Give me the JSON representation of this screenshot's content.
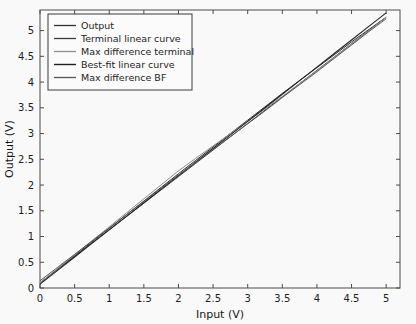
{
  "chart_data": {
    "type": "line",
    "title": "",
    "xlabel": "Input (V)",
    "ylabel": "Output (V)",
    "xlim": [
      0,
      5.2
    ],
    "ylim": [
      0,
      5.4
    ],
    "grid": false,
    "legend_position": "upper left",
    "xticks": [
      "0",
      "0.5",
      "1",
      "1.5",
      "2",
      "2.5",
      "3",
      "3.5",
      "4",
      "4.5",
      "5"
    ],
    "xtick_values": [
      0,
      0.5,
      1,
      1.5,
      2,
      2.5,
      3,
      3.5,
      4,
      4.5,
      5
    ],
    "yticks": [
      "0",
      "0.5",
      "1",
      "1.5",
      "2",
      "2.5",
      "3",
      "3.5",
      "4",
      "4.5",
      "5"
    ],
    "ytick_values": [
      0,
      0.5,
      1,
      1.5,
      2,
      2.5,
      3,
      3.5,
      4,
      4.5,
      5
    ],
    "x": [
      0,
      0.25,
      0.5,
      0.75,
      1,
      1.25,
      1.5,
      1.75,
      2,
      2.25,
      2.5,
      2.75,
      3,
      3.25,
      3.5,
      3.75,
      4,
      4.25,
      4.5,
      4.75,
      5
    ],
    "series": [
      {
        "name": "Output",
        "color": "#2c2c2c",
        "width": 1.0,
        "values": [
          0.1,
          0.365,
          0.63,
          0.895,
          1.16,
          1.425,
          1.69,
          1.955,
          2.22,
          2.48,
          2.74,
          3.0,
          3.26,
          3.52,
          3.78,
          4.03,
          4.28,
          4.53,
          4.78,
          5.02,
          5.26
        ]
      },
      {
        "name": "Terminal linear curve",
        "color": "#3a3a3a",
        "width": 1.0,
        "values": [
          0.1,
          0.358,
          0.616,
          0.874,
          1.132,
          1.39,
          1.648,
          1.906,
          2.164,
          2.422,
          2.68,
          2.938,
          3.196,
          3.454,
          3.712,
          3.97,
          4.228,
          4.486,
          4.744,
          5.002,
          5.26
        ]
      },
      {
        "name": "Max difference terminal",
        "color": "#8f8f8f",
        "width": 1.0,
        "values": [
          0.1,
          0.372,
          0.644,
          0.916,
          1.188,
          1.46,
          1.732,
          2.004,
          2.276,
          2.52,
          2.76,
          3.0,
          3.24,
          3.48,
          3.72,
          3.97,
          4.22,
          4.48,
          4.74,
          5.0,
          5.26
        ]
      },
      {
        "name": "Best-fit linear curve",
        "color": "#1f1f1f",
        "width": 1.1,
        "values": [
          0.075,
          0.3385,
          0.602,
          0.8655,
          1.129,
          1.3925,
          1.656,
          1.9195,
          2.183,
          2.4465,
          2.71,
          2.9735,
          3.237,
          3.5005,
          3.764,
          4.0275,
          4.291,
          4.5545,
          4.818,
          5.0815,
          5.345
        ]
      },
      {
        "name": "Max difference BF",
        "color": "#555555",
        "width": 1.0,
        "values": [
          0.14,
          0.397,
          0.654,
          0.911,
          1.168,
          1.425,
          1.682,
          1.939,
          2.196,
          2.44,
          2.69,
          2.94,
          3.19,
          3.44,
          3.7,
          3.95,
          4.2,
          4.46,
          4.72,
          4.98,
          5.23
        ]
      }
    ]
  }
}
